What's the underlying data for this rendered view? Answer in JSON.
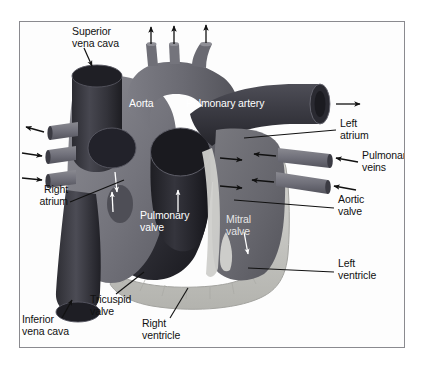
{
  "figure": {
    "frame": {
      "border_color": "#8a8a8f",
      "background": "#fdfdfd"
    }
  },
  "palette": {
    "vessel_dark": "#3b3b42",
    "vessel_dark_edge": "#23232a",
    "chamber_dark": "#242428",
    "tissue_mid": "#6e6e75",
    "tissue_mid_light": "#85858c",
    "myocardium_light": "#c9c9c6",
    "myocardium_edge": "#a8a8a4",
    "label_text": "#111111",
    "label_text_white": "#ffffff",
    "label_text_gray": "#e6e6e6",
    "leader_line": "#111111"
  },
  "labels": {
    "superior_vena_cava": "Superior\nvena cava",
    "aorta": "Aorta",
    "pulmonary_artery": "Pulmonary artery",
    "left_atrium": "Left\natrium",
    "pulmonary_veins": "Pulmonary\nveins",
    "right_atrium": "Right\natrium",
    "aortic_valve": "Aortic\nvalve",
    "pulmonary_valve": "Pulmonary\nvalve",
    "mitral_valve": "Mitral\nvalve",
    "left_ventricle": "Left\nventricle",
    "tricuspid_valve": "Tricuspid\nvalve",
    "right_ventricle": "Right\nventricle",
    "inferior_vena_cava": "Inferior\nvena cava"
  },
  "structures": [
    {
      "name": "superior-vena-cava",
      "label_key": "superior_vena_cava",
      "marker": "arrow-down",
      "text_color": "black"
    },
    {
      "name": "aorta",
      "label_key": "aorta",
      "marker": "none",
      "text_color": "white"
    },
    {
      "name": "pulmonary-artery",
      "label_key": "pulmonary_artery",
      "marker": "none",
      "text_color": "white"
    },
    {
      "name": "left-atrium",
      "label_key": "left_atrium",
      "marker": "leader-line",
      "text_color": "black"
    },
    {
      "name": "pulmonary-veins",
      "label_key": "pulmonary_veins",
      "marker": "arrow-left-x2",
      "text_color": "black"
    },
    {
      "name": "right-atrium",
      "label_key": "right_atrium",
      "marker": "leader-line",
      "text_color": "black"
    },
    {
      "name": "aortic-valve",
      "label_key": "aortic_valve",
      "marker": "leader-line",
      "text_color": "black"
    },
    {
      "name": "pulmonary-valve",
      "label_key": "pulmonary_valve",
      "marker": "arrow-up-white",
      "text_color": "white"
    },
    {
      "name": "mitral-valve",
      "label_key": "mitral_valve",
      "marker": "arrow-down-white",
      "text_color": "gray"
    },
    {
      "name": "left-ventricle",
      "label_key": "left_ventricle",
      "marker": "leader-line",
      "text_color": "black"
    },
    {
      "name": "tricuspid-valve",
      "label_key": "tricuspid_valve",
      "marker": "leader-line",
      "text_color": "black"
    },
    {
      "name": "right-ventricle",
      "label_key": "right_ventricle",
      "marker": "leader-line",
      "text_color": "black"
    },
    {
      "name": "inferior-vena-cava",
      "label_key": "inferior_vena_cava",
      "marker": "arrow-up-right",
      "text_color": "black"
    }
  ],
  "flow_arrows": {
    "aortic_branches_up": 3,
    "left_side_outward": 1,
    "left_side_inward": 2,
    "left_atrium_inward": 2,
    "left_atrium_outward": 2,
    "pulmonary_artery_outward": 1,
    "right_atrium_internal_white": 2
  }
}
